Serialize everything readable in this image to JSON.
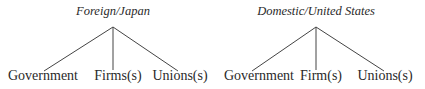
{
  "diagrams": [
    {
      "root": "Foreign/Japan",
      "leaves": [
        "Government",
        "Firms(s)",
        "Unions(s)"
      ]
    },
    {
      "root": "Domestic/United States",
      "leaves": [
        "Government",
        "Firm(s)",
        "Unions(s)"
      ]
    }
  ]
}
